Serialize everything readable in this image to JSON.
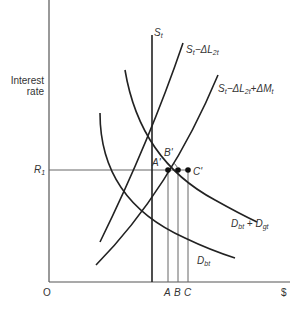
{
  "diagram": {
    "y_axis_label_line1": "Interest",
    "y_axis_label_line2": "rate",
    "x_axis_label": "$",
    "origin_label": "O",
    "rate_label": "R",
    "rate_label_sub": "1",
    "x_ticks": [
      "A",
      "B",
      "C"
    ],
    "points": [
      "A'",
      "B'",
      "C'"
    ],
    "curves": {
      "supply": {
        "base": "S",
        "sub": "t"
      },
      "supply_minus_loans": {
        "base": "S",
        "sub": "t",
        "op": "−ΔL",
        "sub2": "2t"
      },
      "supply_minus_loans_plus_money": {
        "base": "S",
        "sub": "t",
        "op": "−ΔL",
        "sub2": "2t",
        "op2": "+ΔM",
        "sub3": "t"
      },
      "demand_bank": {
        "base": "D",
        "sub": "bt"
      },
      "demand_bank_plus_gov": {
        "base": "D",
        "sub": "bt",
        "op": " + D",
        "sub2": "gt"
      }
    }
  }
}
